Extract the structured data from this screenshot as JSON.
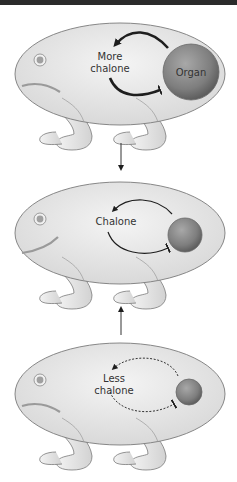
{
  "diagram": {
    "type": "feedback-loop-illustration",
    "colors": {
      "top_bar": "#2b2b2b",
      "body_fill": "#e6e6e6",
      "body_stroke": "#7a7a7a",
      "organ_fill": "#8a8a8a",
      "arrow": "#1e1e1e",
      "text": "#333333"
    },
    "panels": [
      {
        "id": "top",
        "label_line1": "More",
        "label_line2": "chalone",
        "organ_label": "Organ",
        "organ_size": "large",
        "arrow_style": "solid-thick",
        "mouth": "frown"
      },
      {
        "id": "middle",
        "label_line1": "Chalone",
        "label_line2": "",
        "organ_label": "",
        "organ_size": "medium",
        "arrow_style": "solid-thin",
        "mouth": "smile"
      },
      {
        "id": "bottom",
        "label_line1": "Less",
        "label_line2": "chalone",
        "organ_label": "",
        "organ_size": "small",
        "arrow_style": "dashed",
        "mouth": "frown"
      }
    ],
    "transitions": [
      {
        "from": "top",
        "to": "middle",
        "direction": "down"
      },
      {
        "from": "bottom",
        "to": "middle",
        "direction": "up"
      }
    ]
  }
}
